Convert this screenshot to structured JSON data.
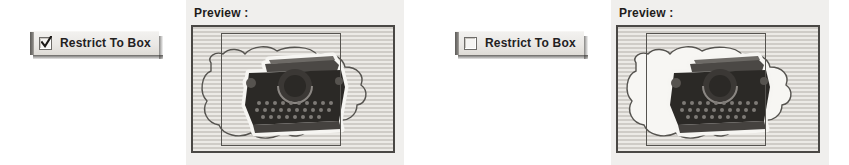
{
  "screen": {
    "width": 849,
    "height": 165,
    "background": "#ffffff",
    "description": "Two side-by-side comparison states of a Restrict To Box checkbox and its image preview"
  },
  "palette": {
    "panel_background": "#f0efed",
    "button_face": "#eae8e5",
    "button_grip": "#5d5b58",
    "frame_border": "#4a4845",
    "stripe_dark": "#cfccc7",
    "stripe_light": "#eceae6",
    "text": "#1e1c1a",
    "artwork_dark": "#2b2926",
    "artwork_halo": "#f6f5f2"
  },
  "variants": [
    {
      "id": "restrict-on",
      "checkbox": {
        "label": "Restrict To Box",
        "checked": true,
        "state_label": "checked",
        "icon": "checkmark-icon"
      },
      "preview": {
        "title": "Preview :",
        "blob_filled": false,
        "blob_description": "selection outline extends past the box but is not filled outside it"
      }
    },
    {
      "id": "restrict-off",
      "checkbox": {
        "label": "Restrict To Box",
        "checked": false,
        "state_label": "unchecked",
        "icon": "empty-box-icon"
      },
      "preview": {
        "title": "Preview :",
        "blob_filled": true,
        "blob_description": "selection blob is filled white and spills outside the box"
      }
    }
  ]
}
